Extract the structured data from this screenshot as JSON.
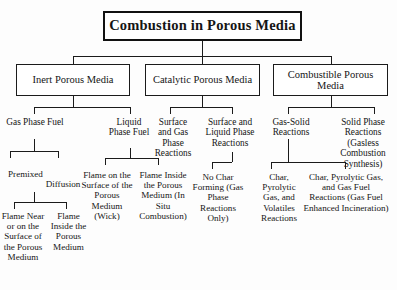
{
  "diagram": {
    "title": "Combustion in Porous Media",
    "type": "hierarchy-tree",
    "orientation": "top-down",
    "levels": 5,
    "colors": {
      "line": "#1b1b1b",
      "box_border": "#1b1b1b",
      "background": "#fdfdfd",
      "text": "#151515"
    },
    "root": {
      "label": "Combustion in Porous Media"
    },
    "level2": [
      {
        "label": "Inert Porous Media"
      },
      {
        "label": "Catalytic Porous Media"
      },
      {
        "label": "Combustible Porous Media"
      }
    ],
    "level3": [
      {
        "label": "Gas Phase Fuel",
        "parent": "Inert Porous Media"
      },
      {
        "label": "Liquid Phase Fuel",
        "parent": "Inert Porous Media"
      },
      {
        "label": "Surface and Gas Phase Reactions",
        "parent": "Catalytic Porous Media"
      },
      {
        "label": "Surface and Liquid Phase Reactions",
        "parent": "Catalytic Porous Media"
      },
      {
        "label": "Gas-Solid Reactions",
        "parent": "Combustible Porous Media"
      },
      {
        "label": "Solid Phase Reactions (Gasless Combustion Synthesis)",
        "parent": "Combustible Porous Media"
      }
    ],
    "level4": [
      {
        "label": "Premixed",
        "parent": "Gas Phase Fuel"
      },
      {
        "label": "Diffusion",
        "parent": "Gas Phase Fuel"
      },
      {
        "label": "Flame on the Surface of the Porous Medium (Wick)",
        "parent": "Liquid Phase Fuel"
      },
      {
        "label": "Flame Inside the Porous Medium (In Situ Combustion)",
        "parent": "Liquid Phase Fuel"
      },
      {
        "label": "No Char Forming (Gas Phase Reactions Only)",
        "parent": "Surface and Liquid Phase Reactions"
      },
      {
        "label": "Char, Pyrolytic Gas, and Volatiles Reactions",
        "parent": "Gas-Solid Reactions"
      },
      {
        "label": "Char, Pyrolytic Gas, and Gas Fuel Reactions (Gas Fuel Enhanced Incineration)",
        "parent": "Gas-Solid Reactions"
      }
    ],
    "level5": [
      {
        "label": "Flame Near or on the Surface of the Porous Medium",
        "parent": "Premixed"
      },
      {
        "label": "Flame Inside the Porous Medium",
        "parent": "Premixed"
      }
    ]
  }
}
